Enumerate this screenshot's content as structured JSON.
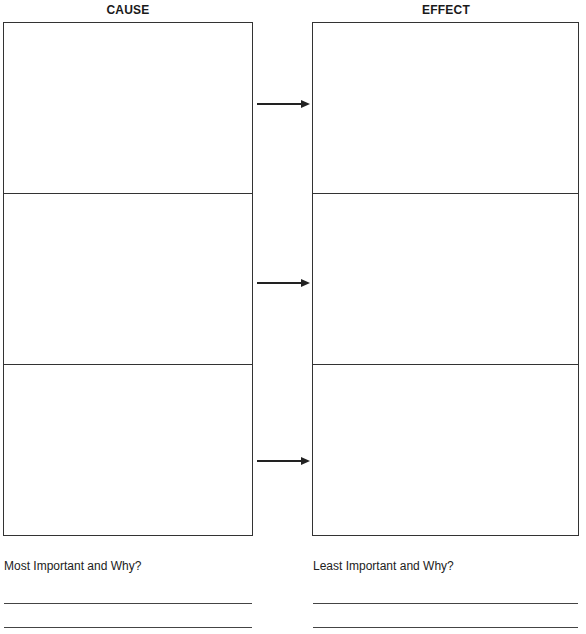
{
  "worksheet": {
    "columns": [
      {
        "title": "CAUSE",
        "rows": [
          "",
          "",
          ""
        ]
      },
      {
        "title": "EFFECT",
        "rows": [
          "",
          "",
          ""
        ]
      }
    ],
    "arrows": [
      {
        "icon": "right-arrow-icon",
        "from": "cause-1",
        "to": "effect-1"
      },
      {
        "icon": "right-arrow-icon",
        "from": "cause-2",
        "to": "effect-2"
      },
      {
        "icon": "right-arrow-icon",
        "from": "cause-3",
        "to": "effect-3"
      }
    ],
    "prompts": {
      "most_important": "Most Important and Why?",
      "least_important": "Least Important and Why?"
    },
    "answers": {
      "most_important": [
        "",
        ""
      ],
      "least_important": [
        "",
        ""
      ]
    },
    "colors": {
      "line": "#333333",
      "text": "#1a1a1a",
      "background": "#ffffff"
    }
  }
}
